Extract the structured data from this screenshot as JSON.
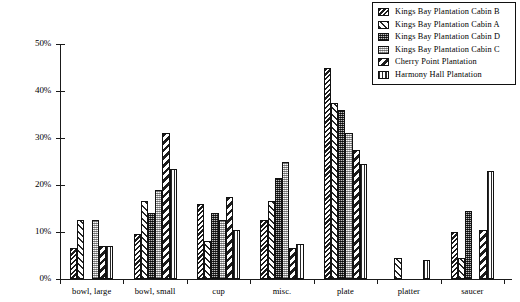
{
  "chart_data": {
    "type": "bar",
    "title": "",
    "subtitle": "",
    "xlabel": "",
    "ylabel": "",
    "ylim": [
      0,
      50
    ],
    "grid": false,
    "legend_position": "top-right",
    "ytick_labels": [
      "0%",
      "10%",
      "20%",
      "30%",
      "40%",
      "50%"
    ],
    "ytick_values": [
      0,
      10,
      20,
      30,
      40,
      50
    ],
    "categories": [
      "bowl, large",
      "bowl, small",
      "cup",
      "misc.",
      "plate",
      "platter",
      "saucer"
    ],
    "series": [
      {
        "name": "Kings Bay Plantation Cabin B",
        "pattern": "dense-back-diagonal-dark",
        "values": [
          6.5,
          9.5,
          16.0,
          12.5,
          45.0,
          0,
          10.0
        ]
      },
      {
        "name": "Kings Bay Plantation Cabin A",
        "pattern": "wide-forward-diagonal-light",
        "values": [
          12.5,
          16.5,
          8.0,
          16.5,
          37.5,
          4.5,
          4.5
        ]
      },
      {
        "name": "Kings Bay Plantation Cabin D",
        "pattern": "dark-fine-checker",
        "values": [
          0,
          14.0,
          14.0,
          21.5,
          36.0,
          0,
          14.5
        ]
      },
      {
        "name": "Kings Bay Plantation Cabin C",
        "pattern": "light-dot-stipple",
        "values": [
          12.5,
          19.0,
          12.5,
          25.0,
          31.0,
          0,
          0
        ]
      },
      {
        "name": "Cherry Point Plantation",
        "pattern": "bold-back-diagonal",
        "values": [
          7.0,
          31.0,
          17.5,
          6.5,
          27.5,
          0,
          10.5
        ]
      },
      {
        "name": "Harmony Hall Plantation",
        "pattern": "vertical-lines",
        "values": [
          7.0,
          23.5,
          10.5,
          7.5,
          24.5,
          4.0,
          23.0
        ]
      }
    ]
  },
  "legend": {
    "items": [
      {
        "label": "Kings Bay Plantation Cabin B"
      },
      {
        "label": "Kings Bay Plantation Cabin A"
      },
      {
        "label": "Kings Bay Plantation Cabin D"
      },
      {
        "label": "Kings Bay Plantation Cabin C"
      },
      {
        "label": "Cherry Point Plantation"
      },
      {
        "label": "Harmony Hall Plantation"
      }
    ]
  }
}
